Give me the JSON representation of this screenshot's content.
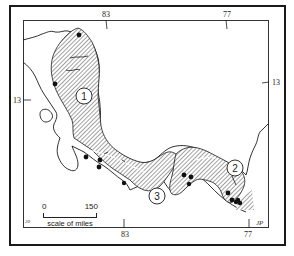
{
  "map": {
    "title": "",
    "longitude_ticks": [
      {
        "label": "83",
        "position": "top"
      },
      {
        "label": "77",
        "position": "top"
      },
      {
        "label": "83",
        "position": "bottom"
      },
      {
        "label": "77",
        "position": "bottom"
      }
    ],
    "latitude_ticks": [
      {
        "label": "13",
        "position": "left"
      },
      {
        "label": "13",
        "position": "right"
      }
    ],
    "regions": [
      {
        "id": "1",
        "label": "1",
        "fill": "hatched"
      },
      {
        "id": "2",
        "label": "2",
        "fill": "hatched"
      },
      {
        "id": "3",
        "label": "3",
        "fill": "hatched"
      }
    ],
    "localities_count": 14,
    "scale": {
      "start": "0",
      "end": "150",
      "caption": "scale of miles"
    },
    "corner_marks": {
      "bottom_left": "20",
      "bottom_right": "JP"
    },
    "colors": {
      "ink": "#1a1a1a",
      "paper": "#ffffff",
      "hatch": "#555555"
    }
  }
}
